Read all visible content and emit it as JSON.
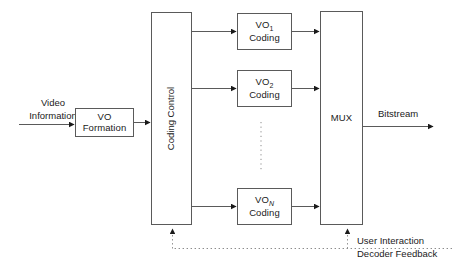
{
  "diagram": {
    "stroke_color": "#5a5a5a",
    "text_color": "#1a1a1a",
    "background": "#ffffff",
    "labels": {
      "video_information_line1": "Video",
      "video_information_line2": "Information",
      "bitstream": "Bitstream",
      "feedback_line1": "User Interaction",
      "feedback_line2": "Decoder Feedback"
    },
    "blocks": {
      "vo_formation": {
        "line1": "VO",
        "line2": "Formation"
      },
      "coding_control": {
        "label": "Coding Control"
      },
      "mux": {
        "label": "MUX"
      },
      "vo_coding": [
        {
          "prefix": "VO",
          "subscript": "1",
          "line2": "Coding",
          "italic_subscript": false
        },
        {
          "prefix": "VO",
          "subscript": "2",
          "line2": "Coding",
          "italic_subscript": false
        },
        {
          "prefix": "VO",
          "subscript": "N",
          "line2": "Coding",
          "italic_subscript": true
        }
      ]
    },
    "ellipsis": {
      "orientation": "vertical",
      "style": "dotted"
    },
    "feedback_path": {
      "style": "dotted",
      "targets": [
        "coding-control",
        "mux"
      ]
    }
  }
}
